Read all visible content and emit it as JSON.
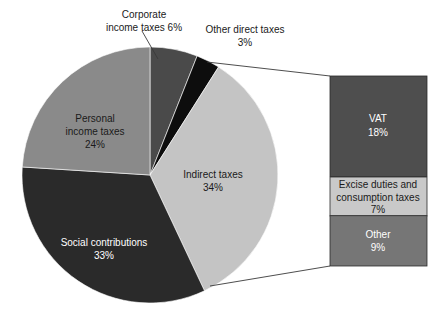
{
  "chart_data": {
    "type": "pie",
    "title": "",
    "subtitle": "",
    "xlabel": "",
    "ylabel": "",
    "legend_position": "none",
    "grid": false,
    "units": "percent",
    "categories": [
      "Corporate income taxes",
      "Other direct taxes",
      "Indirect taxes",
      "Social contributions",
      "Personal income taxes"
    ],
    "values": [
      6,
      3,
      34,
      33,
      24
    ],
    "slices": [
      {
        "name": "Corporate income taxes",
        "label": "Corporate",
        "label_line2": "income taxes 6%",
        "value": 6,
        "value_text": "6%",
        "color": "#4a4a4a",
        "label_color": "#1a1a1a",
        "label_placement": "outside-callout"
      },
      {
        "name": "Other direct taxes",
        "label": "Other direct taxes",
        "label_line2": "3%",
        "value": 3,
        "value_text": "3%",
        "color": "#0d0d0d",
        "label_color": "#1a1a1a",
        "label_placement": "outside"
      },
      {
        "name": "Indirect taxes",
        "label": "Indirect taxes",
        "label_line2": "34%",
        "value": 34,
        "value_text": "34%",
        "color": "#c4c4c4",
        "label_color": "#1a1a1a",
        "label_placement": "inside"
      },
      {
        "name": "Social contributions",
        "label": "Social contributions",
        "label_line2": "33%",
        "value": 33,
        "value_text": "33%",
        "color": "#2a2a2a",
        "label_color": "#ffffff",
        "label_placement": "inside"
      },
      {
        "name": "Personal income taxes",
        "label": "Personal",
        "label_line2": "income taxes",
        "label_line3": "24%",
        "value": 24,
        "value_text": "24%",
        "color": "#8a8a8a",
        "label_color": "#1a1a1a",
        "label_placement": "inside"
      }
    ],
    "breakout": {
      "parent": "Indirect taxes",
      "parent_total": 34,
      "type": "stacked_bar",
      "segments": [
        {
          "name": "VAT",
          "label": "VAT",
          "value": 18,
          "value_text": "18%",
          "color": "#4e4e4e",
          "label_color": "#ffffff"
        },
        {
          "name": "Excise duties and consumption taxes",
          "label": "Excise duties and",
          "label_line2": "consumption taxes",
          "value": 7,
          "value_text": "7%",
          "color": "#c9c9c9",
          "label_color": "#1a1a1a"
        },
        {
          "name": "Other",
          "label": "Other",
          "value": 9,
          "value_text": "9%",
          "color": "#767676",
          "label_color": "#ffffff"
        }
      ]
    }
  },
  "labels": {
    "corporate_line1": "Corporate",
    "corporate_line2": "income taxes 6%",
    "other_direct_line1": "Other direct taxes",
    "other_direct_line2": "3%",
    "indirect_line1": "Indirect taxes",
    "indirect_line2": "34%",
    "social_line1": "Social contributions",
    "social_line2": "33%",
    "personal_line1": "Personal",
    "personal_line2": "income taxes",
    "personal_line3": "24%",
    "vat_line1": "VAT",
    "vat_line2": "18%",
    "excise_line1": "Excise duties and",
    "excise_line2": "consumption taxes",
    "excise_line3": "7%",
    "other_line1": "Other",
    "other_line2": "9%"
  }
}
